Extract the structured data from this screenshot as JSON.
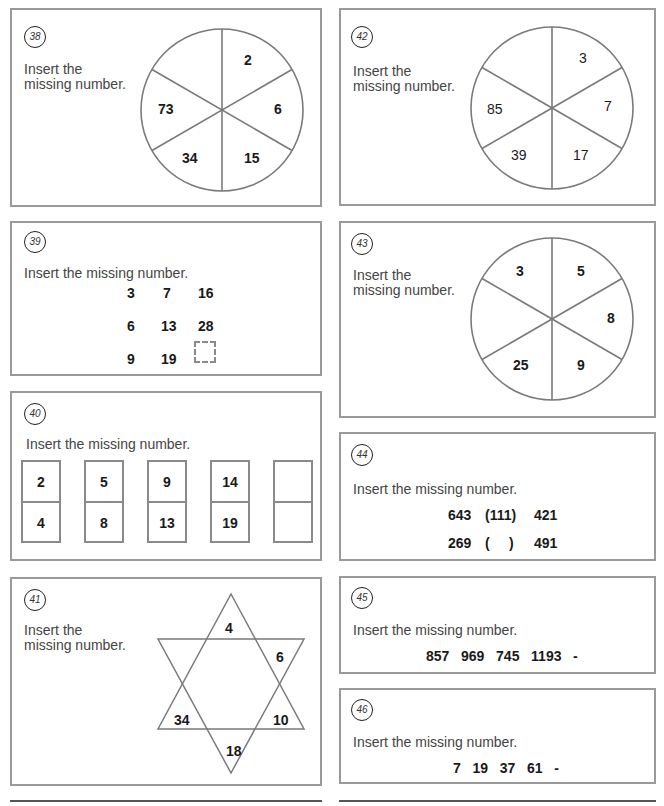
{
  "puzzles": {
    "p38": {
      "number": "38",
      "prompt": "Insert the\nmissing number.",
      "type": "circle-6-segments",
      "segments": [
        "2",
        "6",
        "15",
        "34",
        "73",
        ""
      ]
    },
    "p39": {
      "number": "39",
      "prompt": "Insert the missing number.",
      "type": "grid",
      "rows": [
        [
          "3",
          "7",
          "16"
        ],
        [
          "6",
          "13",
          "28"
        ],
        [
          "9",
          "19",
          "?"
        ]
      ]
    },
    "p40": {
      "number": "40",
      "prompt": "Insert the missing number.",
      "type": "dominoes",
      "dominoes": [
        {
          "top": "2",
          "bottom": "4"
        },
        {
          "top": "5",
          "bottom": "8"
        },
        {
          "top": "9",
          "bottom": "13"
        },
        {
          "top": "14",
          "bottom": "19"
        },
        {
          "top": "",
          "bottom": ""
        }
      ]
    },
    "p41": {
      "number": "41",
      "prompt": "Insert the\nmissing number.",
      "type": "star",
      "points": {
        "top": "4",
        "upper_right": "6",
        "lower_right": "10",
        "bottom": "18",
        "lower_left": "34",
        "upper_left": ""
      }
    },
    "p42": {
      "number": "42",
      "prompt": "Insert the\nmissing number.",
      "type": "circle-6-segments",
      "segments": [
        "3",
        "7",
        "17",
        "39",
        "85",
        ""
      ]
    },
    "p43": {
      "number": "43",
      "prompt": "Insert the\nmissing number.",
      "type": "circle-6-segments",
      "segments": [
        "5",
        "8",
        "9",
        "25",
        "",
        "3"
      ]
    },
    "p44": {
      "number": "44",
      "prompt": "Insert the missing number.",
      "type": "bracket",
      "lines": [
        {
          "left": "643",
          "middle": "(111)",
          "right": "421"
        },
        {
          "left": "269",
          "middle": "(     )",
          "right": "491"
        }
      ]
    },
    "p45": {
      "number": "45",
      "prompt": "Insert the missing number.",
      "type": "sequence",
      "sequence": "857   969   745   1193   -"
    },
    "p46": {
      "number": "46",
      "prompt": "Insert the missing number.",
      "type": "sequence",
      "sequence": "7   19   37   61   -"
    }
  }
}
